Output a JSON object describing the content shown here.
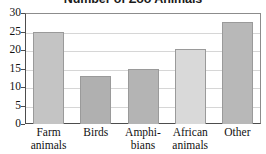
{
  "chart_data": {
    "type": "bar",
    "title": "Number of Zoo Animals",
    "xlabel": "",
    "ylabel": "",
    "ylim": [
      0,
      30
    ],
    "ytick_step": 5,
    "yticks": [
      30,
      25,
      20,
      15,
      10,
      5,
      0
    ],
    "grid": true,
    "grid_axis": "y",
    "legend": false,
    "categories": [
      "Farm animals",
      "Birds",
      "Amphibians",
      "African animals",
      "Other"
    ],
    "category_lines": [
      [
        "Farm",
        "animals"
      ],
      [
        "Birds",
        ""
      ],
      [
        "Amphi-",
        "bians"
      ],
      [
        "African",
        "animals"
      ],
      [
        "Other",
        ""
      ]
    ],
    "values": [
      25,
      13,
      15,
      20.3,
      27.5
    ],
    "bar_colors": [
      "#c4c4c4",
      "#b0b0b0",
      "#b4b4b4",
      "#d9d9d9",
      "#b8b8b8"
    ],
    "bar_border_color": "#9a9a9a"
  },
  "colors": {
    "background": "#ffffff",
    "axis": "#4d4d4d",
    "gridline": "#d6d6d6",
    "text": "#111111"
  }
}
